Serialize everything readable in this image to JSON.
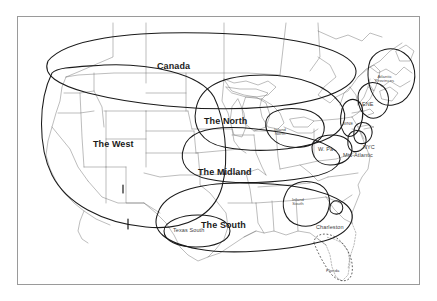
{
  "figure": {
    "type": "map",
    "frame_border_color": "#9a9a9a",
    "background_color": "#ffffff",
    "outline_color": "#555555",
    "isogloss_color": "#1a1a1a"
  },
  "labels": {
    "major": [
      {
        "name": "canada",
        "text": "Canada",
        "x": 155,
        "y": 51
      },
      {
        "name": "the-north",
        "text": "The North",
        "x": 209,
        "y": 106
      },
      {
        "name": "the-west",
        "text": "The West",
        "x": 96,
        "y": 129
      },
      {
        "name": "the-midland",
        "text": "The Midland",
        "x": 213,
        "y": 157
      },
      {
        "name": "the-south",
        "text": "The South",
        "x": 213,
        "y": 210
      }
    ],
    "secondary": [
      {
        "name": "nyc",
        "text": "NYC",
        "x": 357,
        "y": 132
      },
      {
        "name": "mid-atlantic",
        "text": "Mid-Atlantic",
        "x": 347,
        "y": 141
      },
      {
        "name": "charleston",
        "text": "Charleston",
        "x": 318,
        "y": 213
      }
    ],
    "sub_regions": [
      {
        "name": "atlantic-provinces",
        "line1": "Atlantic",
        "line2": "Provinces",
        "x": 373,
        "y": 66
      },
      {
        "name": "ene",
        "text": "ENE",
        "x": 355,
        "y": 92
      },
      {
        "name": "inland-north",
        "line1": "Inland",
        "line2": "North",
        "x": 268,
        "y": 118
      },
      {
        "name": "w-pa",
        "text": "W. Pa",
        "x": 311,
        "y": 137
      },
      {
        "name": "inland-south",
        "line1": "Inland",
        "line2": "South",
        "x": 285,
        "y": 189
      },
      {
        "name": "texas-south",
        "text": "Texas South",
        "x": 179,
        "y": 216
      },
      {
        "name": "florida",
        "text": "Florida",
        "x": 320,
        "y": 257
      },
      {
        "name": "wne",
        "text": "WNE",
        "x": 334,
        "y": 112
      }
    ]
  }
}
